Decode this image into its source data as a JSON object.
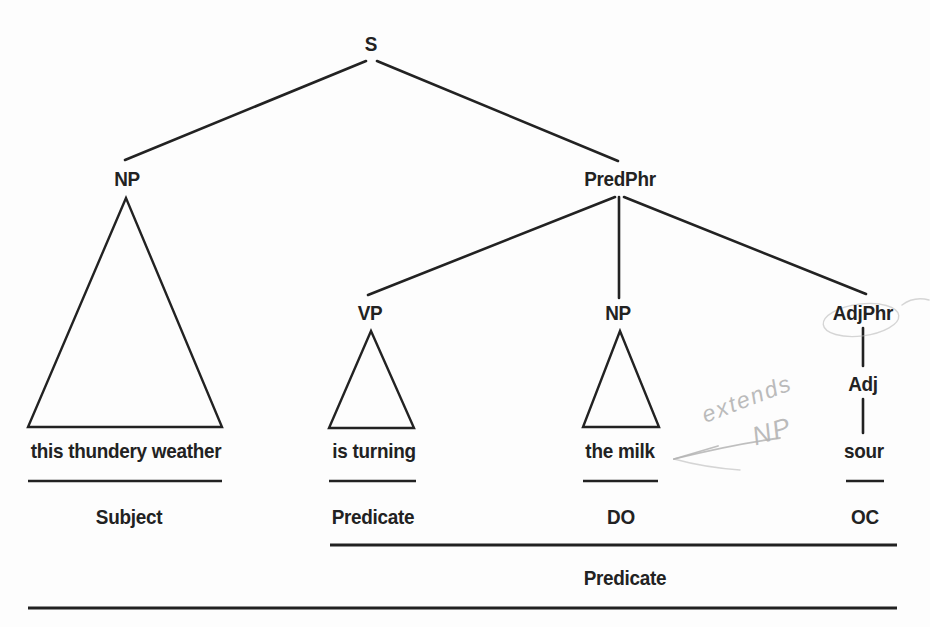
{
  "colors": {
    "background": "#fdfdfd",
    "ink": "#222222",
    "pencil": "#b4b4b4"
  },
  "nodes": {
    "s": "S",
    "np_subject": "NP",
    "predphr": "PredPhr",
    "vp": "VP",
    "np_object": "NP",
    "adjphr": "AdjPhr",
    "adj": "Adj"
  },
  "words": {
    "subject": "this thundery weather",
    "verb": "is turning",
    "direct_object": "the milk",
    "object_complement": "sour"
  },
  "functions": {
    "subject": "Subject",
    "verb_predicate": "Predicate",
    "direct_object": "DO",
    "object_complement": "OC",
    "full_predicate": "Predicate"
  },
  "annotations": {
    "note_line1": "extends",
    "note_line2": "NP"
  }
}
